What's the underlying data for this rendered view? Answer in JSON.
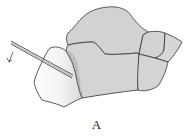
{
  "figure": {
    "label": "A",
    "colors": {
      "bone_fill": "#d4d4d4",
      "outline": "#3a3a3a",
      "fragment_fill": "#eeeeee",
      "texture": "#888888",
      "background": "#ffffff"
    }
  }
}
